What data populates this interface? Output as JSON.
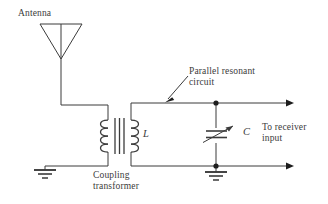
{
  "figure": {
    "kind": "schematic-diagram",
    "stroke_color": "#3b3b3b",
    "background_color": "#ffffff"
  },
  "labels": {
    "antenna": "Antenna",
    "parallel_resonant_line1": "Parallel resonant",
    "parallel_resonant_line2": "circuit",
    "to_receiver_line1": "To receiver",
    "to_receiver_line2": "input",
    "coupling_line1": "Coupling",
    "coupling_line2": "transformer",
    "inductor": "L",
    "capacitor": "C"
  },
  "components": {
    "antenna_symbol": "inverted-triangle-antenna",
    "transformer": {
      "name": "coupling-transformer",
      "primary_turns": 4,
      "secondary_turns": 4,
      "core_lines": 3
    },
    "inductor_symbol": "secondary-coil-inductor",
    "capacitor_symbol": "variable-capacitor",
    "grounds": 2,
    "junction_dots": 2,
    "output_arrows": 2,
    "leader_arrow": "pointer-to-parallel-resonant-circuit"
  }
}
